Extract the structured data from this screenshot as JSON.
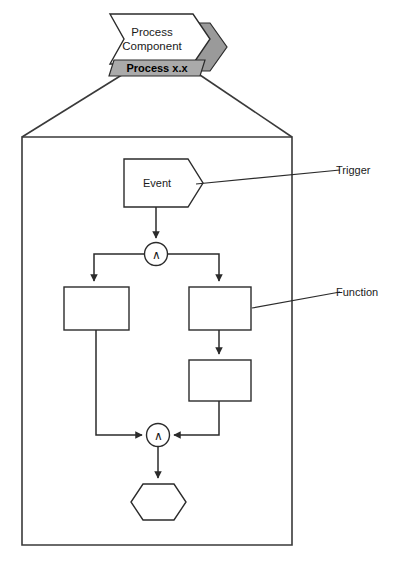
{
  "diagram": {
    "type": "event-driven-process-chain",
    "header": {
      "component_label_line1": "Process",
      "component_label_line2": "Component",
      "version_label": "Process x.x",
      "banner_fill_color": "#aaaaaa",
      "banner_white_color": "#ffffff"
    },
    "nodes": [
      {
        "id": "event-1",
        "kind": "event",
        "shape": "pentagon-arrow",
        "label": "Event"
      },
      {
        "id": "gate-1",
        "kind": "connector",
        "shape": "circle",
        "label": "∧",
        "operator": "AND"
      },
      {
        "id": "function-left",
        "kind": "function",
        "shape": "rectangle",
        "label": ""
      },
      {
        "id": "function-right-top",
        "kind": "function",
        "shape": "rectangle",
        "label": ""
      },
      {
        "id": "function-right-bottom",
        "kind": "function",
        "shape": "rectangle",
        "label": ""
      },
      {
        "id": "gate-2",
        "kind": "connector",
        "shape": "circle",
        "label": "∧",
        "operator": "AND"
      },
      {
        "id": "end-hexagon",
        "kind": "terminator",
        "shape": "hexagon",
        "label": ""
      }
    ],
    "annotations": [
      {
        "id": "annotation-trigger",
        "label": "Trigger",
        "points_to": "event-1"
      },
      {
        "id": "annotation-function",
        "label": "Function",
        "points_to": "function-right-top"
      }
    ],
    "colors": {
      "stroke": "#2b2b2b",
      "frame": "#3a3a3a",
      "background": "#ffffff",
      "banner_gray": "#aaaaaa"
    }
  }
}
